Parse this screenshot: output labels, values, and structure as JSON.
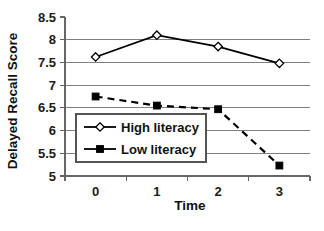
{
  "chart_data": {
    "type": "line",
    "title": "",
    "xlabel": "Time",
    "ylabel": "Delayed Recall Score",
    "x": [
      0,
      1,
      2,
      3
    ],
    "categories": [
      "0",
      "1",
      "2",
      "3"
    ],
    "xtick_labels": [
      "0",
      "1",
      "2",
      "3"
    ],
    "ytick_labels": [
      "5",
      "5.5",
      "6",
      "6.5",
      "7",
      "7.5",
      "8",
      "8.5"
    ],
    "yticks": [
      5,
      5.5,
      6,
      6.5,
      7,
      7.5,
      8,
      8.5
    ],
    "ylim": [
      5,
      8.5
    ],
    "grid": "horizontal",
    "legend_position": "center-left-inside",
    "series": [
      {
        "name": "High literacy",
        "values": [
          7.62,
          8.1,
          7.85,
          7.48
        ],
        "marker": "open-diamond",
        "linestyle": "solid",
        "color": "#000000"
      },
      {
        "name": "Low literacy",
        "values": [
          6.75,
          6.55,
          6.47,
          5.23
        ],
        "marker": "filled-square",
        "linestyle": "dashed",
        "color": "#000000"
      }
    ],
    "legend": [
      "High literacy",
      "Low literacy"
    ]
  },
  "axes": {
    "y_title": "Delayed Recall Score",
    "x_title": "Time"
  },
  "colors": {
    "line": "#000000",
    "grid": "#808080",
    "axis": "#666666",
    "background": "#ffffff",
    "marker_fill_open": "#ffffff",
    "marker_fill_solid": "#000000"
  }
}
